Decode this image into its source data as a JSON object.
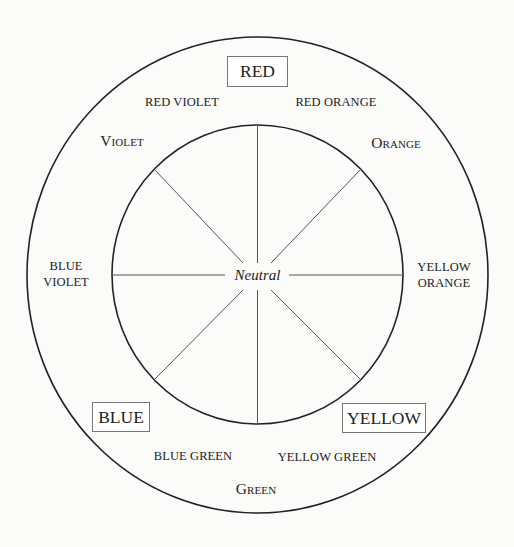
{
  "diagram": {
    "center_label": "Neutral",
    "primaries": [
      {
        "id": "red",
        "label": "RED"
      },
      {
        "id": "yellow",
        "label": "YELLOW"
      },
      {
        "id": "blue",
        "label": "BLUE"
      }
    ],
    "secondaries": [
      {
        "id": "orange",
        "label": "Orange"
      },
      {
        "id": "green",
        "label": "Green"
      },
      {
        "id": "violet",
        "label": "Violet"
      }
    ],
    "tertiaries": [
      {
        "id": "red-orange",
        "label": "RED ORANGE"
      },
      {
        "id": "yellow-orange",
        "line1": "YELLOW",
        "line2": "ORANGE"
      },
      {
        "id": "yellow-green",
        "label": "YELLOW GREEN"
      },
      {
        "id": "blue-green",
        "label": "BLUE GREEN"
      },
      {
        "id": "blue-violet",
        "line1": "BLUE",
        "line2": "VIOLET"
      },
      {
        "id": "red-violet",
        "label": "RED VIOLET"
      }
    ],
    "spoke_count": 8,
    "colors": {
      "stroke": "#222222",
      "spoke": "#555555",
      "box_border": "#777777",
      "background": "#fbfbfa"
    }
  }
}
